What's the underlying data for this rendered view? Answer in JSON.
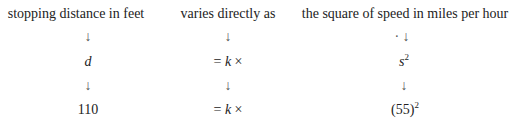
{
  "columns": [
    {
      "header": "stopping distance in feet",
      "row1_arrow": "↓",
      "symbol": "d",
      "row2_arrow": "↓",
      "value": "110"
    },
    {
      "header": "varies directly as",
      "row1_arrow": "↓",
      "symbol_prefix": "= ",
      "symbol_k": "k",
      "symbol_suffix": " ×",
      "row2_arrow": "↓",
      "value_prefix": "= ",
      "value_k": "k",
      "value_suffix": " ×"
    },
    {
      "header": "the square of speed in miles per hour",
      "row1_arrow": "· ↓",
      "symbol_base": "s",
      "symbol_exp": "2",
      "row2_arrow": "↓",
      "value_base": "(55)",
      "value_exp": "2"
    }
  ]
}
